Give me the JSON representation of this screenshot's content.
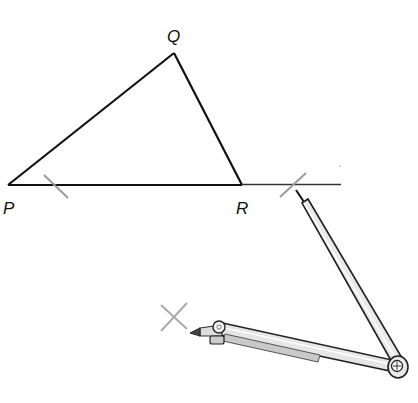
{
  "diagram": {
    "labels": {
      "P": "P",
      "Q": "Q",
      "R": "R"
    },
    "points": {
      "P": [
        8,
        185
      ],
      "Q": [
        174,
        53
      ],
      "R": [
        242,
        185
      ]
    },
    "line_end": [
      341,
      184
    ],
    "arc_marks": [
      {
        "name": "arc-mark-on-PR",
        "center": [
          54,
          186
        ]
      },
      {
        "name": "arc-mark-right",
        "center": [
          294,
          184
        ]
      },
      {
        "name": "arc-mark-lower",
        "center": [
          173,
          318
        ]
      }
    ],
    "compass": {
      "hinge": [
        397,
        368
      ],
      "needle_tip": [
        296,
        190
      ],
      "pencil_tip": [
        190,
        333
      ]
    },
    "colors": {
      "line": "#111111",
      "arc": "#9a9a9a",
      "compass_fill": "#e6e6e6",
      "compass_stroke": "#222222"
    }
  }
}
